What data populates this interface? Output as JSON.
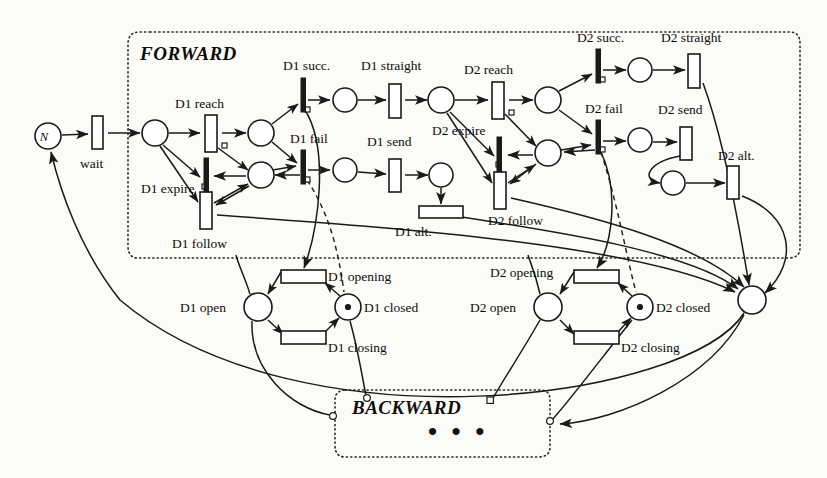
{
  "diagram": {
    "regions": [
      {
        "id": "forward",
        "label": "FORWARD"
      },
      {
        "id": "backward",
        "label": "BACKWARD",
        "ellipsis": "• • •"
      }
    ],
    "places": [
      {
        "id": "p-n",
        "label": "N",
        "label_pos": "inside",
        "token": false,
        "x": 48,
        "y": 136,
        "r": 13
      },
      {
        "id": "p-start",
        "label": "",
        "token": false,
        "x": 155,
        "y": 133,
        "r": 13
      },
      {
        "id": "p-d1reach",
        "label": "",
        "token": false,
        "x": 261,
        "y": 133,
        "r": 13
      },
      {
        "id": "p-d1mid",
        "label": "",
        "token": false,
        "x": 261,
        "y": 175,
        "r": 13
      },
      {
        "id": "p-d1succ",
        "label": "",
        "token": false,
        "x": 345,
        "y": 100,
        "r": 12
      },
      {
        "id": "p-d1fail",
        "label": "",
        "token": false,
        "x": 345,
        "y": 170,
        "r": 12
      },
      {
        "id": "p-d1str",
        "label": "",
        "token": false,
        "x": 441,
        "y": 100,
        "r": 13
      },
      {
        "id": "p-d1send",
        "label": "",
        "token": false,
        "x": 441,
        "y": 175,
        "r": 12
      },
      {
        "id": "p-d2reach",
        "label": "",
        "token": false,
        "x": 548,
        "y": 100,
        "r": 13
      },
      {
        "id": "p-d2mid",
        "label": "",
        "token": false,
        "x": 548,
        "y": 153,
        "r": 13
      },
      {
        "id": "p-d2succ",
        "label": "",
        "token": false,
        "x": 640,
        "y": 70,
        "r": 12
      },
      {
        "id": "p-d2fail",
        "label": "",
        "token": false,
        "x": 640,
        "y": 140,
        "r": 12
      },
      {
        "id": "p-d2alt",
        "label": "",
        "token": false,
        "x": 673,
        "y": 183,
        "r": 12
      },
      {
        "id": "p-merge",
        "label": "",
        "token": false,
        "x": 752,
        "y": 300,
        "r": 14
      },
      {
        "id": "p-d1open",
        "label": "D1 open",
        "label_pos": "left",
        "token": false,
        "x": 258,
        "y": 307,
        "r": 14
      },
      {
        "id": "p-d1closed",
        "label": "D1 closed",
        "label_pos": "right",
        "token": true,
        "x": 348,
        "y": 307,
        "r": 13
      },
      {
        "id": "p-d2open",
        "label": "D2 open",
        "label_pos": "left",
        "token": false,
        "x": 548,
        "y": 307,
        "r": 14
      },
      {
        "id": "p-d2closed",
        "label": "D2 closed",
        "label_pos": "right",
        "token": true,
        "x": 640,
        "y": 307,
        "r": 13
      }
    ],
    "transitions": [
      {
        "id": "t-wait",
        "label": "wait",
        "label_pos": "below",
        "shape": "box-v",
        "x": 98,
        "y": 133
      },
      {
        "id": "t-d1reach",
        "label": "D1 reach",
        "label_pos": "above",
        "shape": "box-v",
        "x": 211,
        "y": 133
      },
      {
        "id": "t-d1expire",
        "label": "D1 expire",
        "label_pos": "left",
        "shape": "bar-v",
        "x": 206,
        "y": 176
      },
      {
        "id": "t-d1follow",
        "label": "D1 follow",
        "label_pos": "below",
        "shape": "box-v",
        "x": 206,
        "y": 210
      },
      {
        "id": "t-d1succ",
        "label": "D1 succ.",
        "label_pos": "above",
        "shape": "bar-v",
        "x": 303,
        "y": 100
      },
      {
        "id": "t-d1fail",
        "label": "D1 fail",
        "label_pos": "above",
        "shape": "bar-v",
        "x": 303,
        "y": 170
      },
      {
        "id": "t-d1straight",
        "label": "D1 straight",
        "label_pos": "above",
        "shape": "box-v",
        "x": 395,
        "y": 100
      },
      {
        "id": "t-d1send",
        "label": "D1 send",
        "label_pos": "above",
        "shape": "box-v",
        "x": 395,
        "y": 175
      },
      {
        "id": "t-d1alt",
        "label": "D1 alt.",
        "label_pos": "below-left",
        "shape": "box-h",
        "x": 441,
        "y": 212
      },
      {
        "id": "t-d2reach",
        "label": "D2 reach",
        "label_pos": "above",
        "shape": "box-v",
        "x": 498,
        "y": 100
      },
      {
        "id": "t-d2expire",
        "label": "D2 expire",
        "label_pos": "left",
        "shape": "bar-v",
        "x": 500,
        "y": 155
      },
      {
        "id": "t-d2follow",
        "label": "D2 follow",
        "label_pos": "below",
        "shape": "box-v",
        "x": 500,
        "y": 190
      },
      {
        "id": "t-d2succ",
        "label": "D2 succ.",
        "label_pos": "above",
        "shape": "bar-v",
        "x": 598,
        "y": 70
      },
      {
        "id": "t-d2fail",
        "label": "D2 fail",
        "label_pos": "above",
        "shape": "bar-v",
        "x": 598,
        "y": 140
      },
      {
        "id": "t-d2straight",
        "label": "D2 straight",
        "label_pos": "above",
        "shape": "box-v",
        "x": 694,
        "y": 70
      },
      {
        "id": "t-d2send",
        "label": "D2 send",
        "label_pos": "above",
        "shape": "box-v",
        "x": 686,
        "y": 143
      },
      {
        "id": "t-d2alt",
        "label": "D2 alt.",
        "label_pos": "above-right",
        "shape": "box-v",
        "x": 733,
        "y": 183
      },
      {
        "id": "t-d1opening",
        "label": "D1 opening",
        "label_pos": "right",
        "shape": "box-h",
        "x": 303,
        "y": 277
      },
      {
        "id": "t-d1closing",
        "label": "D1 closing",
        "label_pos": "right",
        "shape": "box-h",
        "x": 303,
        "y": 337
      },
      {
        "id": "t-d2opening",
        "label": "D2 opening",
        "label_pos": "left",
        "shape": "box-h",
        "x": 596,
        "y": 277
      },
      {
        "id": "t-d2closing",
        "label": "D2 closing",
        "label_pos": "right",
        "shape": "box-h",
        "x": 596,
        "y": 337
      }
    ],
    "colors": {
      "stroke": "#1a1a1a",
      "fill": "#ffffff",
      "background": "#fbfbf8",
      "region_border": "#2a2a2a"
    }
  }
}
